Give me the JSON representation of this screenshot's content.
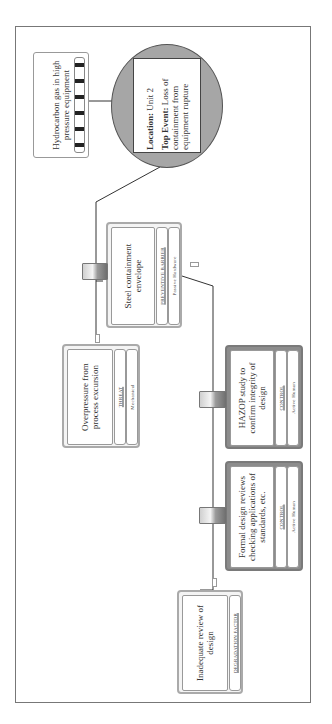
{
  "diagram": {
    "type": "bowtie",
    "orientation": "rotated-90-ccw",
    "hazard": {
      "label": "Hydrocarbon gas in high pressure equipment"
    },
    "top_event": {
      "location_label": "Location:",
      "location_value": "Unit 2",
      "event_label": "Top Event:",
      "event_value": "Loss of containment from equipment rupture"
    },
    "preventive_barrier": {
      "label": "Steel containment envelope",
      "category": "PREVENTIVE BARRIER",
      "type": "Passive Hardware"
    },
    "threat": {
      "label": "Overpressure from process excursion",
      "category": "THREAT",
      "type": "Mechanical"
    },
    "controls": [
      {
        "label": "HAZOP study to confirm integrity of design",
        "category": "CONTROL",
        "type": "Active Human"
      },
      {
        "label": "Formal design reviews checking applications of standards, etc.",
        "category": "CONTROL",
        "type": "Active Human"
      }
    ],
    "degradation_factor": {
      "label": "Inadequate review of design",
      "category": "DEGRADATION FACTOR"
    }
  },
  "colors": {
    "top_event_fill": "#a6a6a6",
    "control_fill": "#8c8c8c",
    "hazard_stripe": "#222222"
  }
}
